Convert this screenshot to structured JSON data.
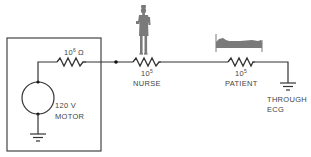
{
  "diagram": {
    "type": "electrical-circuit",
    "motor": {
      "voltage_label": "120 V",
      "name_label": "MOTOR"
    },
    "motor_resistor": {
      "base": "10",
      "exponent": "6",
      "unit": "Ω"
    },
    "nurse_resistor": {
      "base": "10",
      "exponent": "5",
      "name_label": "NURSE"
    },
    "patient_resistor": {
      "base": "10",
      "exponent": "5",
      "name_label": "PATIENT"
    },
    "ground": {
      "line1": "THROUGH",
      "line2": "ECG"
    },
    "icons": [
      "nurse-figure-icon",
      "patient-in-bed-icon",
      "ground-icon",
      "resistor-icon"
    ],
    "colors": {
      "wire": "#333333",
      "silhouette": "#7a7a7a",
      "text": "#444444"
    }
  }
}
